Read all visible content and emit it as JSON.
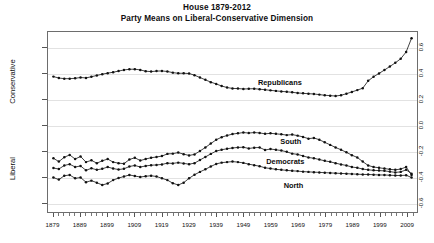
{
  "title": {
    "line1": "House 1879-2012",
    "line2": "Party Means on Liberal-Conservative Dimension"
  },
  "axes": {
    "y_label_top": "Conservative",
    "y_label_bottom": "Liberal",
    "y_ticks": [
      "0.6",
      "0.4",
      "0.2",
      "0.0",
      "-0.2",
      "-0.4",
      "-0.6"
    ],
    "x_ticks": [
      "1879",
      "1889",
      "1899",
      "1909",
      "1919",
      "1929",
      "1939",
      "1949",
      "1959",
      "1969",
      "1979",
      "1989",
      "1999",
      "2009"
    ]
  },
  "annotations": [
    {
      "name": "republicans",
      "text": "Republicans",
      "x": 1962,
      "y": 0.335
    },
    {
      "name": "south",
      "text": "South",
      "x": 1966,
      "y": -0.115
    },
    {
      "name": "democrats",
      "text": "Democrats",
      "x": 1964,
      "y": -0.275
    },
    {
      "name": "north",
      "text": "North",
      "x": 1967,
      "y": -0.455
    }
  ],
  "chart_data": {
    "type": "line",
    "xlabel": "",
    "ylabel": "Liberal-Conservative Dimension",
    "xlim": [
      1877,
      2013
    ],
    "ylim": [
      -0.68,
      0.72
    ],
    "yticks": [
      0.6,
      0.4,
      0.2,
      0.0,
      -0.2,
      -0.4,
      -0.6
    ],
    "xticks": [
      1879,
      1889,
      1899,
      1909,
      1919,
      1929,
      1939,
      1949,
      1959,
      1969,
      1979,
      1989,
      1999,
      2009
    ],
    "grid": true,
    "legend": "inline-annotations",
    "marker": "filled-circle",
    "x": [
      1879,
      1881,
      1883,
      1885,
      1887,
      1889,
      1891,
      1893,
      1895,
      1897,
      1899,
      1901,
      1903,
      1905,
      1907,
      1909,
      1911,
      1913,
      1915,
      1917,
      1919,
      1921,
      1923,
      1925,
      1927,
      1929,
      1931,
      1933,
      1935,
      1937,
      1939,
      1941,
      1943,
      1945,
      1947,
      1949,
      1951,
      1953,
      1955,
      1957,
      1959,
      1961,
      1963,
      1965,
      1967,
      1969,
      1971,
      1973,
      1975,
      1977,
      1979,
      1981,
      1983,
      1985,
      1987,
      1989,
      1991,
      1993,
      1995,
      1997,
      1999,
      2001,
      2003,
      2005,
      2007,
      2009,
      2011
    ],
    "series": [
      {
        "name": "Republicans",
        "values": [
          0.373,
          0.362,
          0.357,
          0.357,
          0.36,
          0.366,
          0.363,
          0.372,
          0.382,
          0.392,
          0.4,
          0.407,
          0.416,
          0.425,
          0.43,
          0.431,
          0.425,
          0.415,
          0.412,
          0.416,
          0.417,
          0.413,
          0.404,
          0.399,
          0.399,
          0.397,
          0.384,
          0.366,
          0.348,
          0.33,
          0.316,
          0.3,
          0.288,
          0.281,
          0.28,
          0.277,
          0.278,
          0.279,
          0.275,
          0.271,
          0.266,
          0.262,
          0.258,
          0.255,
          0.251,
          0.246,
          0.243,
          0.24,
          0.238,
          0.233,
          0.228,
          0.225,
          0.222,
          0.228,
          0.24,
          0.254,
          0.268,
          0.283,
          0.34,
          0.372,
          0.398,
          0.424,
          0.452,
          0.48,
          0.512,
          0.565,
          0.672
        ]
      },
      {
        "name": "South",
        "values": [
          -0.262,
          -0.288,
          -0.254,
          -0.236,
          -0.268,
          -0.248,
          -0.292,
          -0.278,
          -0.3,
          -0.282,
          -0.268,
          -0.292,
          -0.3,
          -0.304,
          -0.272,
          -0.258,
          -0.28,
          -0.268,
          -0.258,
          -0.252,
          -0.245,
          -0.228,
          -0.226,
          -0.218,
          -0.23,
          -0.24,
          -0.232,
          -0.206,
          -0.178,
          -0.148,
          -0.118,
          -0.098,
          -0.085,
          -0.074,
          -0.068,
          -0.062,
          -0.066,
          -0.062,
          -0.065,
          -0.072,
          -0.068,
          -0.072,
          -0.076,
          -0.082,
          -0.078,
          -0.086,
          -0.096,
          -0.11,
          -0.104,
          -0.118,
          -0.138,
          -0.158,
          -0.178,
          -0.196,
          -0.216,
          -0.238,
          -0.256,
          -0.288,
          -0.318,
          -0.33,
          -0.336,
          -0.342,
          -0.348,
          -0.352,
          -0.346,
          -0.33,
          -0.392
        ]
      },
      {
        "name": "Democrats",
        "values": [
          -0.338,
          -0.346,
          -0.318,
          -0.308,
          -0.33,
          -0.322,
          -0.356,
          -0.34,
          -0.352,
          -0.344,
          -0.33,
          -0.342,
          -0.35,
          -0.344,
          -0.326,
          -0.318,
          -0.33,
          -0.322,
          -0.316,
          -0.314,
          -0.31,
          -0.3,
          -0.302,
          -0.296,
          -0.302,
          -0.308,
          -0.3,
          -0.276,
          -0.252,
          -0.228,
          -0.206,
          -0.196,
          -0.188,
          -0.182,
          -0.178,
          -0.176,
          -0.186,
          -0.18,
          -0.178,
          -0.198,
          -0.19,
          -0.196,
          -0.202,
          -0.212,
          -0.226,
          -0.232,
          -0.244,
          -0.256,
          -0.262,
          -0.272,
          -0.282,
          -0.29,
          -0.3,
          -0.31,
          -0.318,
          -0.33,
          -0.336,
          -0.346,
          -0.352,
          -0.356,
          -0.358,
          -0.36,
          -0.366,
          -0.372,
          -0.368,
          -0.352,
          -0.382
        ]
      },
      {
        "name": "North",
        "values": [
          -0.412,
          -0.428,
          -0.398,
          -0.392,
          -0.418,
          -0.412,
          -0.448,
          -0.436,
          -0.452,
          -0.47,
          -0.458,
          -0.432,
          -0.416,
          -0.404,
          -0.392,
          -0.4,
          -0.408,
          -0.402,
          -0.398,
          -0.404,
          -0.418,
          -0.432,
          -0.456,
          -0.47,
          -0.452,
          -0.418,
          -0.39,
          -0.368,
          -0.348,
          -0.326,
          -0.306,
          -0.296,
          -0.292,
          -0.288,
          -0.292,
          -0.298,
          -0.308,
          -0.316,
          -0.324,
          -0.336,
          -0.342,
          -0.348,
          -0.352,
          -0.356,
          -0.36,
          -0.362,
          -0.366,
          -0.368,
          -0.37,
          -0.372,
          -0.374,
          -0.376,
          -0.378,
          -0.38,
          -0.382,
          -0.384,
          -0.386,
          -0.388,
          -0.388,
          -0.39,
          -0.392,
          -0.392,
          -0.394,
          -0.396,
          -0.396,
          -0.394,
          -0.412
        ]
      }
    ]
  }
}
